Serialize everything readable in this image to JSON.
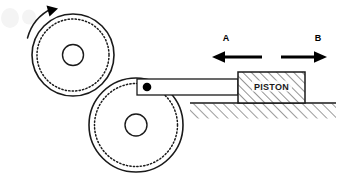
{
  "figure": {
    "background_color": "#ffffff",
    "stroke_color": "#1a1a1a",
    "width": 354,
    "height": 187
  },
  "labels": {
    "direction_a": "A",
    "direction_b": "B",
    "piston": "PISTON"
  },
  "arrows": {
    "a": {
      "label": "A",
      "direction": "left",
      "x_start": 262,
      "x_end": 213,
      "y": 57,
      "label_x": 226,
      "label_y": 41
    },
    "b": {
      "label": "B",
      "direction": "right",
      "x_start": 281,
      "x_end": 326,
      "y": 57,
      "label_x": 318,
      "label_y": 41
    },
    "rotation": {
      "name": "counter-clockwise-rotation-arrow",
      "direction": "counter-clockwise"
    }
  },
  "wheels": [
    {
      "name": "upper-crank-wheel",
      "cx": 73,
      "cy": 55,
      "outer_radius": 41,
      "dotted_radius": 36,
      "hub_radius": 10.5
    },
    {
      "name": "lower-crank-wheel",
      "cx": 136,
      "cy": 125,
      "outer_radius": 47,
      "dotted_radius": 41.5,
      "hub_radius": 11
    }
  ],
  "connecting_rod": {
    "name": "connecting-rod",
    "x": 137,
    "y": 79,
    "width": 101,
    "height": 16
  },
  "crank_pin": {
    "name": "crank-pin",
    "cx": 147,
    "cy": 87,
    "radius": 4.3
  },
  "piston": {
    "name": "piston-block",
    "x": 238,
    "y": 72,
    "width": 67,
    "height": 31,
    "hatch_pattern": "diagonal-45",
    "text": "PISTON"
  },
  "ground": {
    "name": "ground-surface",
    "x_start": 190,
    "x_end": 336,
    "y": 103,
    "hatch_depth": 15,
    "hatch_pattern": "diagonal-45"
  }
}
